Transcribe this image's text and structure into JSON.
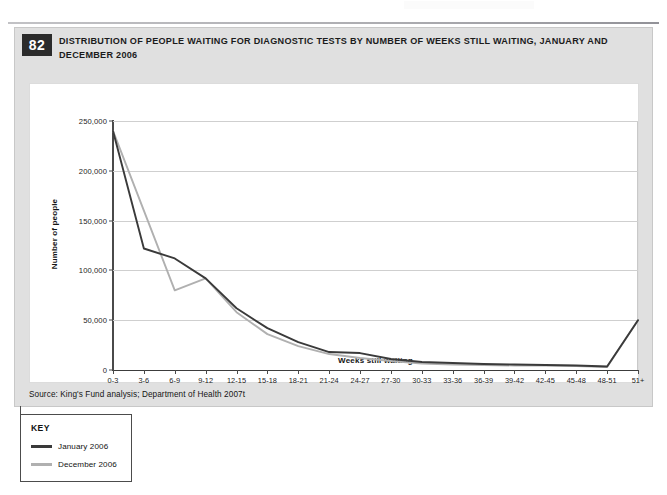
{
  "figure": {
    "number": "82",
    "title": "DISTRIBUTION OF PEOPLE WAITING FOR DIAGNOSTIC TESTS BY NUMBER OF WEEKS STILL WAITING, JANUARY AND DECEMBER 2006",
    "source": "Source: King's Fund analysis; Department of Health 2007t"
  },
  "key": {
    "heading": "KEY",
    "entries": [
      {
        "label": "January 2006",
        "color": "#3a3a3a"
      },
      {
        "label": "December 2006",
        "color": "#b0b0b0"
      }
    ]
  },
  "chart_data": {
    "type": "line",
    "title": "DISTRIBUTION OF PEOPLE WAITING FOR DIAGNOSTIC TESTS BY NUMBER OF WEEKS STILL WAITING, JANUARY AND DECEMBER 2006",
    "xlabel": "Weeks still waiting",
    "ylabel": "Number of people",
    "ylim": [
      0,
      250000
    ],
    "ytick_labels": [
      "0",
      "50,000",
      "100,000",
      "150,000",
      "200,000",
      "250,000"
    ],
    "ytick_values": [
      0,
      50000,
      100000,
      150000,
      200000,
      250000
    ],
    "grid": true,
    "legend_position": "below-left (KEY box)",
    "categories": [
      "0-3",
      "3-6",
      "6-9",
      "9-12",
      "12-15",
      "15-18",
      "18-21",
      "21-24",
      "24-27",
      "27-30",
      "30-33",
      "33-36",
      "36-39",
      "39-42",
      "42-45",
      "45-48",
      "48-51",
      "51+"
    ],
    "series": [
      {
        "name": "January 2006",
        "color": "#3a3a3a",
        "values": [
          240000,
          122000,
          112000,
          92000,
          62000,
          42000,
          28000,
          18000,
          17000,
          11000,
          8000,
          7000,
          6000,
          5500,
          5000,
          4500,
          3500,
          50000
        ]
      },
      {
        "name": "December 2006",
        "color": "#b0b0b0",
        "values": [
          240000,
          160000,
          80000,
          92000,
          58000,
          36000,
          24000,
          16000,
          12000,
          9000,
          6500,
          5500,
          5000,
          4500,
          4500,
          4000,
          3000,
          50000
        ]
      }
    ]
  }
}
